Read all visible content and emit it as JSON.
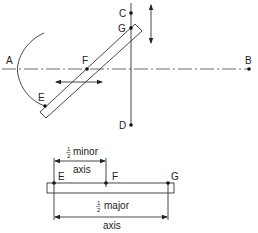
{
  "figure": {
    "type": "ellipse trammel construction",
    "top_view": {
      "points": {
        "A": "A",
        "B": "B",
        "C": "C",
        "D": "D",
        "E": "E",
        "F": "F",
        "G": "G"
      }
    },
    "bottom_view": {
      "points": {
        "E": "E",
        "F": "F",
        "G": "G"
      },
      "minor_dimension": {
        "fraction": "1/2",
        "fraction_num": "1",
        "fraction_den": "2",
        "line1": "minor",
        "line2": "axis"
      },
      "major_dimension": {
        "fraction": "1/2",
        "fraction_num": "1",
        "fraction_den": "2",
        "line1": "major",
        "line2": "axis"
      }
    }
  }
}
